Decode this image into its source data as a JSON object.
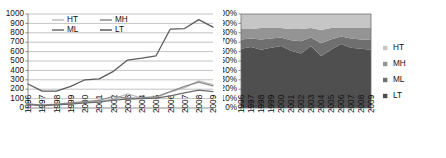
{
  "figure": {
    "background": "#ffffff",
    "panels": [
      "line-chart",
      "stacked-area-chart"
    ]
  },
  "chart_data": [
    {
      "type": "line",
      "panel": "left",
      "title": "",
      "subtitle": "",
      "xlabel": "",
      "ylabel": "",
      "grid": true,
      "grid_axis": "y",
      "legend_position": "top-inside",
      "categories": [
        "1996",
        "1997",
        "1998",
        "1999",
        "2000",
        "2001",
        "2002",
        "2003",
        "2004",
        "2005",
        "2006",
        "2007",
        "2008",
        "2009"
      ],
      "x": [
        "1996",
        "1997",
        "1998",
        "1999",
        "2000",
        "2001",
        "2002",
        "2003",
        "2004",
        "2005",
        "2006",
        "2007",
        "2008",
        "2009"
      ],
      "ylim": [
        0,
        1000
      ],
      "yticks": [
        0,
        100,
        200,
        300,
        400,
        500,
        600,
        700,
        800,
        900,
        1000
      ],
      "ytick_labels": [
        "0",
        "100",
        "200",
        "300",
        "400",
        "500",
        "600",
        "700",
        "800",
        "900",
        "1000"
      ],
      "series": [
        {
          "name": "HT",
          "color": "#bdbdbd",
          "values": [
            40,
            28,
            35,
            45,
            60,
            70,
            95,
            150,
            105,
            110,
            170,
            215,
            290,
            250
          ]
        },
        {
          "name": "MH",
          "color": "#8a8a8a",
          "values": [
            45,
            30,
            40,
            55,
            68,
            80,
            125,
            105,
            108,
            120,
            175,
            230,
            275,
            235
          ]
        },
        {
          "name": "ML",
          "color": "#6b6b6b",
          "values": [
            35,
            25,
            32,
            42,
            55,
            62,
            85,
            95,
            100,
            105,
            130,
            160,
            190,
            175
          ]
        },
        {
          "name": "LT",
          "color": "#5a5a5a",
          "values": [
            255,
            180,
            180,
            230,
            300,
            310,
            390,
            510,
            530,
            555,
            840,
            845,
            940,
            860
          ]
        }
      ]
    },
    {
      "type": "area",
      "stacked": "100%",
      "panel": "right",
      "title": "",
      "subtitle": "",
      "xlabel": "",
      "ylabel": "",
      "grid": false,
      "legend_position": "right",
      "categories": [
        "1996",
        "1997",
        "1998",
        "1999",
        "2000",
        "2001",
        "2002",
        "2003",
        "2004",
        "2005",
        "2006",
        "2007",
        "2008",
        "2009"
      ],
      "x": [
        "1996",
        "1997",
        "1998",
        "1999",
        "2000",
        "2001",
        "2002",
        "2003",
        "2004",
        "2005",
        "2006",
        "2007",
        "2008",
        "2009"
      ],
      "ylim": [
        0,
        100
      ],
      "yticks": [
        0,
        10,
        20,
        30,
        40,
        50,
        60,
        70,
        80,
        90,
        100
      ],
      "ytick_labels": [
        "0%",
        "10%",
        "20%",
        "30%",
        "40%",
        "50%",
        "60%",
        "70%",
        "80%",
        "90%",
        "100%"
      ],
      "series": [
        {
          "name": "LT",
          "color": "#4f4f4f",
          "values": [
            63,
            65,
            62,
            64,
            66,
            61,
            58,
            66,
            55,
            62,
            68,
            64,
            63,
            62
          ]
        },
        {
          "name": "ML",
          "color": "#6f6f6f",
          "values": [
            10,
            9,
            11,
            10,
            9,
            11,
            13,
            9,
            14,
            11,
            8,
            10,
            10,
            11
          ]
        },
        {
          "name": "MH",
          "color": "#949494",
          "values": [
            11,
            10,
            12,
            11,
            10,
            12,
            13,
            10,
            14,
            12,
            9,
            11,
            12,
            12
          ]
        },
        {
          "name": "HT",
          "color": "#c6c6c6",
          "values": [
            16,
            16,
            15,
            15,
            15,
            16,
            16,
            15,
            17,
            15,
            15,
            15,
            15,
            15
          ]
        }
      ],
      "legend_entries": [
        {
          "label": "HT",
          "color": "#c6c6c6",
          "marker": "square"
        },
        {
          "label": "MH",
          "color": "#949494",
          "marker": "square"
        },
        {
          "label": "ML",
          "color": "#6f6f6f",
          "marker": "square"
        },
        {
          "label": "LT",
          "color": "#4f4f4f",
          "marker": "square"
        }
      ]
    }
  ]
}
